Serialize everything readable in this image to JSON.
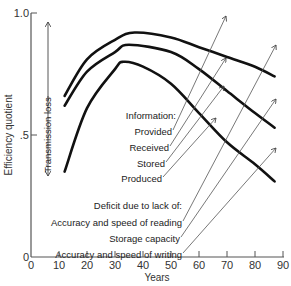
{
  "chart_data": {
    "type": "line",
    "title": "",
    "xlabel": "Years",
    "ylabel": "Efficiency quotient",
    "xlim": [
      0,
      90
    ],
    "ylim": [
      0,
      1.0
    ],
    "x_ticks": [
      "0",
      "10",
      "20",
      "30",
      "40",
      "50",
      "60",
      "70",
      "80",
      "90"
    ],
    "y_ticks": [
      "0",
      ".5",
      "1.0"
    ],
    "grid": false,
    "series": [
      {
        "name": "Upper curve",
        "x": [
          12,
          20,
          30,
          37,
          50,
          60,
          70,
          80,
          87
        ],
        "values": [
          0.66,
          0.81,
          0.89,
          0.92,
          0.9,
          0.86,
          0.82,
          0.78,
          0.74
        ]
      },
      {
        "name": "Middle curve",
        "x": [
          12,
          20,
          30,
          35,
          50,
          60,
          70,
          80,
          87
        ],
        "values": [
          0.62,
          0.76,
          0.84,
          0.87,
          0.84,
          0.77,
          0.68,
          0.59,
          0.53
        ]
      },
      {
        "name": "Lower curve",
        "x": [
          12,
          20,
          30,
          33,
          40,
          50,
          60,
          70,
          80,
          87
        ],
        "values": [
          0.35,
          0.61,
          0.77,
          0.8,
          0.78,
          0.71,
          0.59,
          0.47,
          0.38,
          0.31
        ]
      }
    ],
    "annotations": {
      "transmission_loss": "Transmission loss",
      "information_header": "Information:",
      "information_items": [
        "Provided",
        "Received",
        "Stored",
        "Produced"
      ],
      "deficit_header": "Deficit due to lack of:",
      "deficit_items": [
        "Accuracy and speed of reading",
        "Storage capacity",
        "Accuracy and speed of writing"
      ]
    }
  }
}
